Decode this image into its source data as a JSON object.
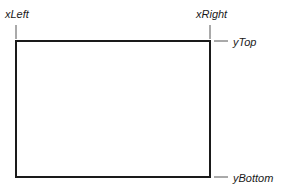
{
  "diagram": {
    "labels": {
      "x_left": "xLeft",
      "x_right": "xRight",
      "y_top": "yTop",
      "y_bottom": "yBottom"
    },
    "colors": {
      "stroke": "#1a1a1a",
      "tick": "#555555",
      "background": "#ffffff"
    }
  }
}
